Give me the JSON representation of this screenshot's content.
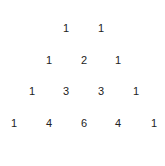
{
  "triangle": {
    "rows": [
      [
        "1",
        "1"
      ],
      [
        "1",
        "2",
        "1"
      ],
      [
        "1",
        "3",
        "3",
        "1"
      ],
      [
        "1",
        "4",
        "6",
        "4",
        "1"
      ]
    ]
  }
}
